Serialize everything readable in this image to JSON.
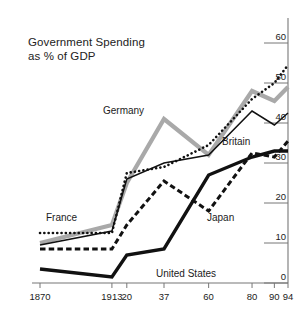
{
  "chart_data": {
    "type": "line",
    "title": "Government Spending\nas % of GDP",
    "xlabel": "",
    "ylabel": "",
    "ylim": [
      0,
      60
    ],
    "yticks": [
      0,
      10,
      20,
      30,
      40,
      50,
      60
    ],
    "ytick_labels": [
      "0",
      "10",
      "20",
      "30",
      "40",
      "50",
      "60"
    ],
    "y_axis_position": "right",
    "grid": false,
    "legend": "inline-annotations",
    "x": [
      1870,
      1913,
      1920,
      1937,
      1960,
      1980,
      1990,
      1994
    ],
    "xtick_labels": [
      "1870",
      "1913",
      "20",
      "37",
      "60",
      "80",
      "90",
      "94"
    ],
    "series": [
      {
        "name": "France",
        "style": "dotted",
        "color": "#111111",
        "values": [
          12.5,
          12.5,
          27.5,
          29.0,
          34.5,
          46.0,
          50.0,
          54.5
        ]
      },
      {
        "name": "Germany",
        "style": "solid-thick-gray",
        "color": "#a9a9a9",
        "values": [
          10.0,
          14.5,
          25.0,
          41.0,
          32.0,
          48.0,
          45.5,
          49.0
        ]
      },
      {
        "name": "Britain",
        "style": "solid-thin",
        "color": "#111111",
        "values": [
          9.5,
          13.0,
          26.0,
          30.0,
          32.0,
          43.0,
          39.5,
          42.5
        ]
      },
      {
        "name": "Japan",
        "style": "dashed",
        "color": "#111111",
        "values": [
          8.5,
          8.5,
          14.5,
          25.5,
          18.0,
          32.5,
          31.5,
          35.5
        ]
      },
      {
        "name": "United States",
        "style": "solid-thick-black",
        "color": "#111111",
        "values": [
          3.5,
          1.5,
          7.0,
          8.5,
          27.0,
          31.5,
          33.0,
          33.0
        ]
      }
    ],
    "annotations": [
      {
        "text": "Germany",
        "x_px": 103,
        "y_px": 105
      },
      {
        "text": "Britain",
        "x_px": 222,
        "y_px": 136
      },
      {
        "text": "France",
        "x_px": 46,
        "y_px": 212
      },
      {
        "text": "Japan",
        "x_px": 207,
        "y_px": 212
      },
      {
        "text": "United States",
        "x_px": 156,
        "y_px": 268
      }
    ]
  }
}
